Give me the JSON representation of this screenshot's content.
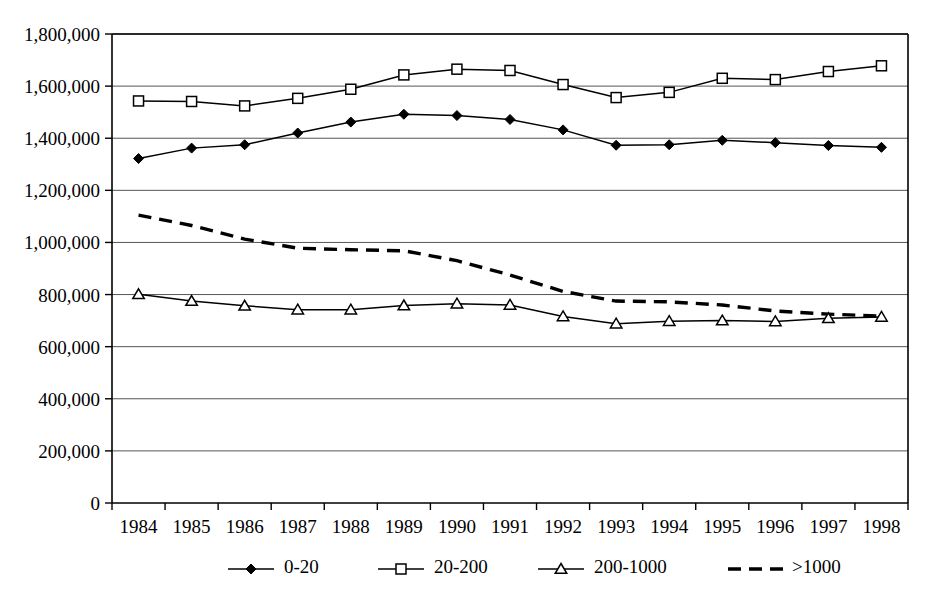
{
  "chart_data": {
    "type": "line",
    "title": "",
    "subtitle": "",
    "xlabel": "",
    "ylabel": "",
    "categories": [
      "1984",
      "1985",
      "1986",
      "1987",
      "1988",
      "1989",
      "1990",
      "1991",
      "1992",
      "1993",
      "1994",
      "1995",
      "1996",
      "1997",
      "1998"
    ],
    "ylim": [
      0,
      1800000
    ],
    "ytick_values": [
      0,
      200000,
      400000,
      600000,
      800000,
      1000000,
      1200000,
      1400000,
      1600000,
      1800000
    ],
    "ytick_labels": [
      "0",
      "200,000",
      "400,000",
      "600,000",
      "800,000",
      "1,000,000",
      "1,200,000",
      "1,400,000",
      "1,600,000",
      "1,800,000"
    ],
    "grid": true,
    "grid_axis": "y",
    "legend_position": "bottom",
    "series": [
      {
        "name": "0-20",
        "marker": "filled-diamond",
        "line_style": "solid",
        "color": "#000000",
        "values": [
          1322000,
          1362000,
          1375000,
          1420000,
          1462000,
          1492000,
          1487000,
          1472000,
          1432000,
          1373000,
          1375000,
          1392000,
          1383000,
          1372000,
          1365000
        ]
      },
      {
        "name": "20-200",
        "marker": "open-square",
        "line_style": "solid",
        "color": "#000000",
        "values": [
          1543000,
          1541000,
          1524000,
          1553000,
          1588000,
          1643000,
          1665000,
          1660000,
          1606000,
          1556000,
          1576000,
          1630000,
          1625000,
          1656000,
          1678000
        ]
      },
      {
        "name": "200-1000",
        "marker": "open-triangle",
        "line_style": "solid",
        "color": "#000000",
        "values": [
          801000,
          775000,
          757000,
          742000,
          742000,
          758000,
          765000,
          760000,
          716000,
          688000,
          698000,
          700000,
          697000,
          709000,
          714000
        ]
      },
      {
        "name": ">1000",
        "marker": "none",
        "line_style": "dashed",
        "color": "#000000",
        "values": [
          1105000,
          1065000,
          1013000,
          978000,
          972000,
          968000,
          930000,
          875000,
          812000,
          775000,
          772000,
          760000,
          737000,
          725000,
          717000
        ]
      }
    ]
  },
  "legend": {
    "items": [
      {
        "label": "0-20",
        "marker": "filled-diamond",
        "style": "solid"
      },
      {
        "label": "20-200",
        "marker": "open-square",
        "style": "solid"
      },
      {
        "label": "200-1000",
        "marker": "open-triangle",
        "style": "solid"
      },
      {
        "label": ">1000",
        "marker": "none",
        "style": "dashed"
      }
    ]
  }
}
